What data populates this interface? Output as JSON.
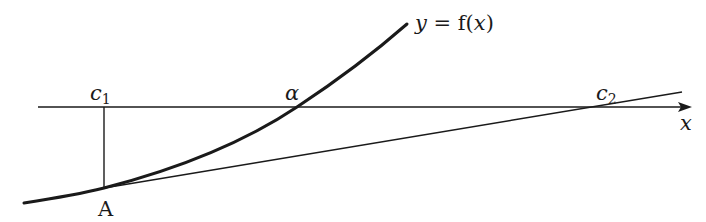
{
  "diagram": {
    "colors": {
      "stroke": "#1a1a1a",
      "background": "#ffffff"
    },
    "labels": {
      "curve": {
        "y": "y",
        "eq": " = ",
        "f": "f(",
        "x": "x",
        "close": ")"
      },
      "c1": {
        "base": "c",
        "sub": "1"
      },
      "alpha": "α",
      "c2": {
        "base": "c",
        "sub": "2"
      },
      "x_axis": "x",
      "point_A": "A"
    },
    "geometry": {
      "x_axis": {
        "x1": 38,
        "x2": 692,
        "y": 107
      },
      "vertical_line": {
        "x": 104,
        "y1": 107,
        "y2": 188
      },
      "point_A": {
        "x": 104,
        "y": 188
      },
      "alpha_point": {
        "x": 297,
        "y": 107
      },
      "c2_point": {
        "x": 598,
        "y": 107
      },
      "tangent": {
        "x1": 104,
        "y1": 188,
        "x2": 682,
        "y2": 92
      },
      "curve_end": {
        "x": 407,
        "y": 24
      }
    }
  }
}
